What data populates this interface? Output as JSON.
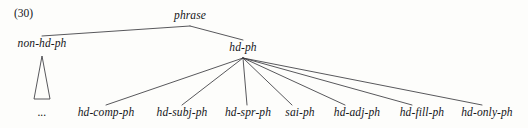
{
  "figure": {
    "example_number": "(30)",
    "root": "phrase",
    "line_color": "#3a3a3e",
    "text_color": "#15161a",
    "background_color": "#fdfdfb"
  },
  "nodes": {
    "root": {
      "label": "phrase",
      "x": 190,
      "y": 20
    },
    "non_head": {
      "label": "non-hd-ph",
      "x": 42,
      "y": 48
    },
    "head": {
      "label": "hd-ph",
      "x": 243,
      "y": 52
    },
    "non_head_ellipsis": {
      "label": "...",
      "x": 42,
      "y": 117
    }
  },
  "leaves": [
    {
      "label": "hd-comp-ph",
      "x": 106,
      "y": 117
    },
    {
      "label": "hd-subj-ph",
      "x": 182,
      "y": 117
    },
    {
      "label": "hd-spr-ph",
      "x": 248,
      "y": 117
    },
    {
      "label": "sai-ph",
      "x": 300,
      "y": 117
    },
    {
      "label": "hd-adj-ph",
      "x": 357,
      "y": 117
    },
    {
      "label": "hd-fill-ph",
      "x": 422,
      "y": 117
    },
    {
      "label": "hd-only-ph",
      "x": 487,
      "y": 117
    }
  ],
  "edges": {
    "top": [
      {
        "from": "phrase",
        "to": "non-hd-ph",
        "x1": 190,
        "y1": 26,
        "x2": 42,
        "y2": 36
      },
      {
        "from": "phrase",
        "to": "hd-ph",
        "x1": 190,
        "y1": 26,
        "x2": 243,
        "y2": 40
      }
    ],
    "fan": [
      {
        "from": "hd-ph",
        "to": "hd-comp-ph",
        "x1": 243,
        "y1": 58,
        "x2": 106,
        "y2": 105
      },
      {
        "from": "hd-ph",
        "to": "hd-subj-ph",
        "x1": 243,
        "y1": 58,
        "x2": 182,
        "y2": 105
      },
      {
        "from": "hd-ph",
        "to": "hd-spr-ph",
        "x1": 243,
        "y1": 58,
        "x2": 247,
        "y2": 105
      },
      {
        "from": "hd-ph",
        "to": "sai-ph",
        "x1": 243,
        "y1": 58,
        "x2": 292,
        "y2": 105
      },
      {
        "from": "hd-ph",
        "to": "hd-adj-ph",
        "x1": 243,
        "y1": 58,
        "x2": 345,
        "y2": 105
      },
      {
        "from": "hd-ph",
        "to": "hd-fill-ph",
        "x1": 243,
        "y1": 58,
        "x2": 412,
        "y2": 105
      },
      {
        "from": "hd-ph",
        "to": "hd-only-ph",
        "x1": 243,
        "y1": 58,
        "x2": 482,
        "y2": 105
      }
    ]
  },
  "abbreviation_triangle": {
    "under": "non-hd-ph",
    "apex_x": 42,
    "apex_y": 56,
    "base_left_x": 34,
    "base_right_x": 50,
    "base_y": 99
  }
}
